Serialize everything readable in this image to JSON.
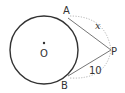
{
  "diagram": {
    "type": "circle-tangents",
    "circle": {
      "center_label": "O"
    },
    "points": {
      "A": "A",
      "B": "B",
      "P": "P",
      "O": "O"
    },
    "segments": {
      "AP": {
        "label": "x"
      },
      "BP": {
        "label": "10"
      }
    },
    "colors": {
      "stroke": "#333333",
      "tangent": "#555555",
      "dotted": "#aaaaaa"
    }
  }
}
